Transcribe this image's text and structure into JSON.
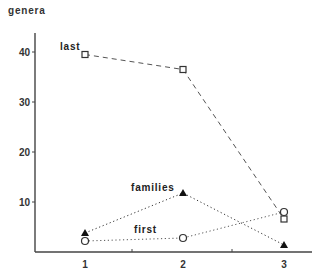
{
  "chart_data": {
    "type": "line",
    "title": "",
    "xlabel": "",
    "ylabel": "genera",
    "x": [
      1,
      2,
      3
    ],
    "xticks": [
      "1",
      "2",
      "3"
    ],
    "yticks": [
      "10",
      "20",
      "30",
      "40"
    ],
    "ylim": [
      0,
      44
    ],
    "xlim": [
      0.5,
      3.27
    ],
    "grid": false,
    "legend": "inline labels",
    "series": [
      {
        "name": "last",
        "values": [
          39.5,
          36.5,
          6.6
        ],
        "marker": "open-square",
        "line": "dashed",
        "color": "#555555",
        "label_pos": {
          "x": 60,
          "y": 50
        }
      },
      {
        "name": "families",
        "values": [
          3.8,
          11.8,
          1.4
        ],
        "marker": "filled-triangle",
        "line": "dotted",
        "color": "#333333",
        "label_pos": {
          "x": 131,
          "y": 191
        }
      },
      {
        "name": "first",
        "values": [
          2.2,
          2.8,
          8.0
        ],
        "marker": "open-circle",
        "line": "dotted",
        "color": "#555555",
        "label_pos": {
          "x": 134,
          "y": 233
        }
      }
    ]
  },
  "layout": {
    "origin_x": 35,
    "origin_y": 252,
    "axis_top": 33,
    "axis_right": 312,
    "px_per_unit_y": 5.0,
    "x_positions": {
      "1": 85,
      "2": 183,
      "3": 284
    },
    "minor_ticks_x": [
      132,
      232
    ]
  }
}
